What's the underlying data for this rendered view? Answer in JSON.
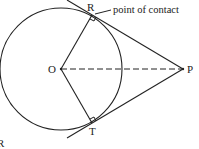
{
  "diagram": {
    "labels": {
      "center": "O",
      "contact_top": "R",
      "contact_bottom": "T",
      "external_point": "P",
      "annotation": "point of contact",
      "stray_label": "R"
    },
    "elements": {
      "circle": "circle with center O",
      "radius_OR": "radius OR, perpendicular to tangent at R",
      "radius_OT": "radius OT, perpendicular to tangent at T",
      "tangent_PR": "tangent line through P and R",
      "tangent_PT": "tangent line through P and T",
      "segment_OP": "dashed segment OP"
    },
    "colors": {
      "stroke": "#222222",
      "background": "#ffffff"
    }
  }
}
